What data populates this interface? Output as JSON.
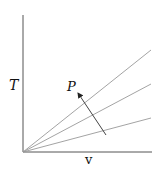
{
  "diagram": {
    "type": "T-v diagram with isobars",
    "y_axis_label": "T",
    "x_axis_label": "v",
    "arrow_label": "P",
    "lines": [
      {
        "name": "isobar-1",
        "x1": 23,
        "y1": 152,
        "x2": 151,
        "y2": 50
      },
      {
        "name": "isobar-2",
        "x1": 23,
        "y1": 152,
        "x2": 151,
        "y2": 84
      },
      {
        "name": "isobar-3",
        "x1": 23,
        "y1": 152,
        "x2": 151,
        "y2": 118
      }
    ],
    "arrow": {
      "from": [
        106,
        135
      ],
      "to": [
        77,
        92
      ],
      "meaning": "increasing P"
    },
    "colors": {
      "axes": "#555555",
      "lines": "#999999",
      "arrow": "#333333"
    }
  }
}
